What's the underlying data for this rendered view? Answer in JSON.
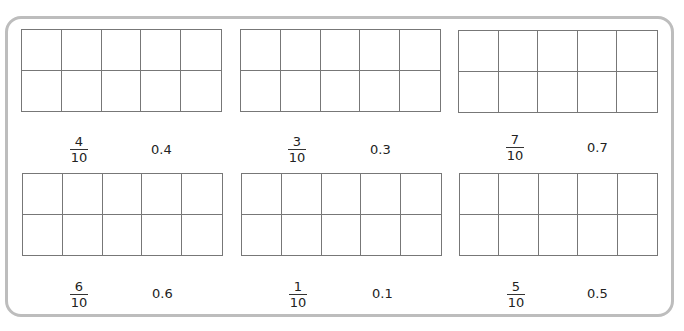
{
  "worksheet": {
    "title": "",
    "items": [
      {
        "numerator": "4",
        "denominator": "10",
        "decimal": "0.4",
        "grid": {
          "rows": 2,
          "cols": 5
        }
      },
      {
        "numerator": "3",
        "denominator": "10",
        "decimal": "0.3",
        "grid": {
          "rows": 2,
          "cols": 5
        }
      },
      {
        "numerator": "7",
        "denominator": "10",
        "decimal": "0.7",
        "grid": {
          "rows": 2,
          "cols": 5
        }
      },
      {
        "numerator": "6",
        "denominator": "10",
        "decimal": "0.6",
        "grid": {
          "rows": 2,
          "cols": 5
        }
      },
      {
        "numerator": "1",
        "denominator": "10",
        "decimal": "0.1",
        "grid": {
          "rows": 2,
          "cols": 5
        }
      },
      {
        "numerator": "5",
        "denominator": "10",
        "decimal": "0.5",
        "grid": {
          "rows": 2,
          "cols": 5
        }
      }
    ],
    "colors": {
      "frame_border": "#bdbdbd",
      "grid_line": "#777777",
      "background": "#ffffff"
    }
  }
}
